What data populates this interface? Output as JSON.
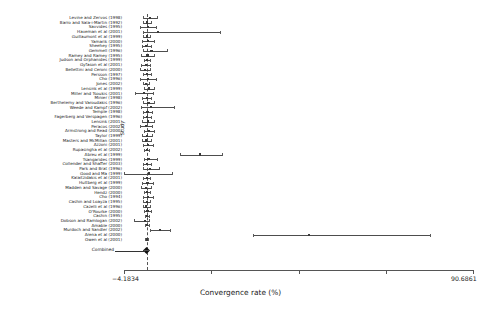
{
  "chart_data": {
    "type": "forest",
    "title": "",
    "xlabel": "Convergence rate (%)",
    "ylabel": "Study",
    "xlim": [
      -4.1834,
      90.6861
    ],
    "xticklabels": [
      "−4.1834",
      "90.6861"
    ],
    "xtick_values": [
      -4.1834,
      90.6861
    ],
    "n_ticks": 5,
    "grid": false,
    "reference_line": 2.0,
    "combined_label": "Combined",
    "combined": {
      "estimate": 2.05,
      "ci_low": 1.3,
      "ci_high": 2.8
    },
    "studies": [
      {
        "label": "Levine and Zervos (1998)",
        "estimate": 2.8,
        "ci_low": 0.9,
        "ci_high": 4.7
      },
      {
        "label": "Barro and Sala-i-Martin (1992)",
        "estimate": 2.1,
        "ci_low": 1.0,
        "ci_high": 3.2
      },
      {
        "label": "Savvides (1995)",
        "estimate": 2.3,
        "ci_low": 0.2,
        "ci_high": 4.4
      },
      {
        "label": "Haveman et al (2001)",
        "estimate": 5.0,
        "ci_low": 1.1,
        "ci_high": 22.0
      },
      {
        "label": "Guillaumont et al (1999)",
        "estimate": 2.0,
        "ci_low": 1.0,
        "ci_high": 3.0
      },
      {
        "label": "Yamarik (2000)",
        "estimate": 2.4,
        "ci_low": 0.7,
        "ci_high": 4.1
      },
      {
        "label": "Sheehey (1995)",
        "estimate": 1.9,
        "ci_low": 0.6,
        "ci_high": 3.2
      },
      {
        "label": "Gemmell (1996)",
        "estimate": 3.3,
        "ci_low": 0.9,
        "ci_high": 7.5
      },
      {
        "label": "Ramey and Ramey (1995)",
        "estimate": 2.2,
        "ci_low": 0.5,
        "ci_high": 3.9
      },
      {
        "label": "Judson and Orphanides (1999)",
        "estimate": 2.0,
        "ci_low": 1.2,
        "ci_high": 2.8
      },
      {
        "label": "Gyfason et al (2001)",
        "estimate": 1.7,
        "ci_low": 0.4,
        "ci_high": 3.0
      },
      {
        "label": "Bellettini and Ceroni (2000)",
        "estimate": 1.5,
        "ci_low": 0.2,
        "ci_high": 2.8
      },
      {
        "label": "Persson (1997)",
        "estimate": 2.1,
        "ci_low": 1.1,
        "ci_high": 3.1
      },
      {
        "label": "Cho (1996)",
        "estimate": 2.4,
        "ci_low": 0.3,
        "ci_high": 4.5
      },
      {
        "label": "Jones (2002)",
        "estimate": 1.9,
        "ci_low": 1.1,
        "ci_high": 2.7
      },
      {
        "label": "Lensink et al (1999)",
        "estimate": 2.6,
        "ci_low": 1.2,
        "ci_high": 4.0
      },
      {
        "label": "Miller and Tsoukis (2001)",
        "estimate": 1.3,
        "ci_low": -1.2,
        "ci_high": 3.8
      },
      {
        "label": "Minier (1998)",
        "estimate": 2.0,
        "ci_low": 0.8,
        "ci_high": 3.2
      },
      {
        "label": "Berthelemy and Varoudakis (1996)",
        "estimate": 2.5,
        "ci_low": 1.0,
        "ci_high": 4.0
      },
      {
        "label": "Weede and Kampf (2002)",
        "estimate": 3.2,
        "ci_low": 0.5,
        "ci_high": 9.5
      },
      {
        "label": "Temple (1998)",
        "estimate": 2.2,
        "ci_low": 1.0,
        "ci_high": 3.4
      },
      {
        "label": "Fagerberg and Verspagen (1996)",
        "estimate": 2.0,
        "ci_low": 0.9,
        "ci_high": 3.1
      },
      {
        "label": "Lensink (2001)",
        "estimate": 2.3,
        "ci_low": 0.6,
        "ci_high": 4.0
      },
      {
        "label": "Peracos (2002)",
        "estimate": 1.8,
        "ci_low": 0.3,
        "ci_high": 3.3
      },
      {
        "label": "Armstrong and Read (2000)",
        "estimate": 2.6,
        "ci_low": 1.2,
        "ci_high": 4.0
      },
      {
        "label": "Taylor (1999)",
        "estimate": 2.1,
        "ci_low": 0.8,
        "ci_high": 3.4
      },
      {
        "label": "Masters and McMillan (2001)",
        "estimate": 1.9,
        "ci_low": 0.7,
        "ci_high": 3.1
      },
      {
        "label": "Azzoni (2001)",
        "estimate": 2.4,
        "ci_low": 1.0,
        "ci_high": 3.8
      },
      {
        "label": "Rupasingha et al (2002)",
        "estimate": 2.0,
        "ci_low": 1.3,
        "ci_high": 2.7
      },
      {
        "label": "Abreu et al (1999)",
        "estimate": 16.5,
        "ci_low": 11.0,
        "ci_high": 22.5
      },
      {
        "label": "Tsangarides (1999)",
        "estimate": 2.5,
        "ci_low": 1.2,
        "ci_high": 4.8
      },
      {
        "label": "Collender and Shaffer (2003)",
        "estimate": 2.1,
        "ci_low": 1.0,
        "ci_high": 3.2
      },
      {
        "label": "Park and Brat (1996)",
        "estimate": 2.8,
        "ci_low": 0.9,
        "ci_high": 5.2
      },
      {
        "label": "Good and Ma (1999)",
        "estimate": 2.6,
        "ci_low": -4.2,
        "ci_high": 9.0
      },
      {
        "label": "Kalaitzidakis et al (2001)",
        "estimate": 2.0,
        "ci_low": 1.0,
        "ci_high": 3.0
      },
      {
        "label": "Hultberg et al (1999)",
        "estimate": 2.2,
        "ci_low": 0.8,
        "ci_high": 3.6
      },
      {
        "label": "Madden and Savage (2000)",
        "estimate": 1.8,
        "ci_low": 0.5,
        "ci_high": 3.1
      },
      {
        "label": "Hendz (2000)",
        "estimate": 2.1,
        "ci_low": 1.2,
        "ci_high": 3.0
      },
      {
        "label": "Cho (1994)",
        "estimate": 2.3,
        "ci_low": 0.9,
        "ci_high": 3.7
      },
      {
        "label": "Cashin and Loayza (1995)",
        "estimate": 2.0,
        "ci_low": 1.1,
        "ci_high": 2.9
      },
      {
        "label": "Cazelli et al (1996)",
        "estimate": 1.9,
        "ci_low": 1.0,
        "ci_high": 2.8
      },
      {
        "label": "O'Rourke (2000)",
        "estimate": 2.2,
        "ci_low": 1.3,
        "ci_high": 3.1
      },
      {
        "label": "Cashin (1995)",
        "estimate": 2.0,
        "ci_low": 1.4,
        "ci_high": 2.6
      },
      {
        "label": "Dobson and Ramlogan (2002)",
        "estimate": 1.6,
        "ci_low": -1.5,
        "ci_high": 2.6
      },
      {
        "label": "Amable (2000)",
        "estimate": 2.1,
        "ci_low": 1.5,
        "ci_high": 2.7
      },
      {
        "label": "Murdoch and Sandler (2002)",
        "estimate": 5.5,
        "ci_low": 2.8,
        "ci_high": 8.2
      },
      {
        "label": "Arena et al (2000)",
        "estimate": 46.0,
        "ci_low": 31.0,
        "ci_high": 79.0
      },
      {
        "label": "Owen et al (2001)",
        "estimate": 2.0,
        "ci_low": 1.6,
        "ci_high": 2.4
      }
    ]
  }
}
